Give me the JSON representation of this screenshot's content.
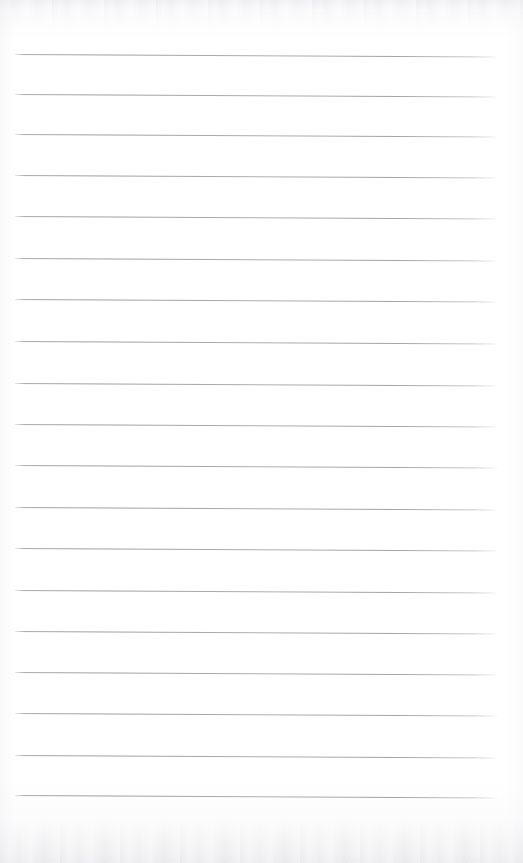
{
  "document": {
    "kind": "scanned-ruled-notepad-page",
    "title": "Blank ruled notepad page",
    "orientation": "portrait",
    "width_px": 523,
    "height_px": 863,
    "text_content": "",
    "handwriting_present": false,
    "printed_text_present": false
  },
  "colors": {
    "paper": "#fefefe",
    "paper_top_tint": "#f4f4f6",
    "paper_bottom_tint": "#f2f2f4",
    "rule_line": "#a0a0a8",
    "rule_line_faded": "#c8c8ce"
  },
  "rules": {
    "count": 19,
    "line_thickness_px": 1,
    "left_x_px": 15,
    "right_x_px": 497,
    "skew_degrees": 0.3,
    "average_spacing_px": 41,
    "y_positions": [
      54,
      94,
      134,
      175,
      216,
      258,
      299,
      341,
      383,
      424,
      465,
      507,
      548,
      590,
      631,
      672,
      713,
      755,
      795
    ]
  },
  "margins": {
    "top_blank_px": 54,
    "bottom_blank_px": 68,
    "left_px": 15,
    "right_px": 26
  },
  "scan_artifacts": {
    "top_edge_band": true,
    "bottom_edge_band": true,
    "edge_noise_color": "#c6c6cc"
  }
}
